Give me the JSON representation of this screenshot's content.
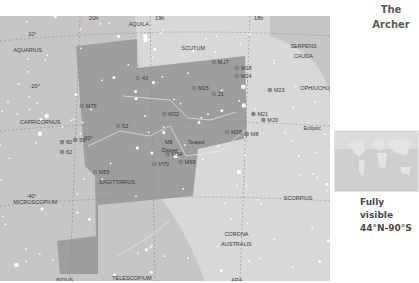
{
  "title": {
    "line1": "The",
    "line2": "Archer"
  },
  "visibility": {
    "line1": "Fully visible",
    "line2": "44°N-90°S"
  },
  "colors": {
    "background": "#c6c6c6",
    "sagittarius_area": "#9e9e9e",
    "milky_way": "#d8d8d8",
    "grid_line": "#8c8c8c",
    "constellation_line": "#e8e8e8",
    "star": "#ffffff"
  },
  "chart_data": {
    "type": "map",
    "ra_labels": [
      {
        "text": "20h",
        "x": 0.27,
        "y": 0.02
      },
      {
        "text": "19h",
        "x": 0.47,
        "y": 0.02
      },
      {
        "text": "18h",
        "x": 0.77,
        "y": 0.02
      }
    ],
    "dec_labels": [
      {
        "text": "-10°",
        "x": 0.08,
        "y": 0.1
      },
      {
        "text": "-20°",
        "x": 0.09,
        "y": 0.36
      },
      {
        "text": "-30°",
        "x": 0.25,
        "y": 0.62
      },
      {
        "text": "-40°",
        "x": 0.08,
        "y": 0.91
      }
    ],
    "constellations": [
      {
        "name": "AQUARIUS",
        "x": 0.04,
        "y": 0.18
      },
      {
        "name": "AQUILA",
        "x": 0.39,
        "y": 0.05
      },
      {
        "name": "SCUTUM",
        "x": 0.55,
        "y": 0.17
      },
      {
        "name": "SERPENS",
        "x": 0.88,
        "y": 0.16
      },
      {
        "name": "CAUDA",
        "x": 0.89,
        "y": 0.21
      },
      {
        "name": "OPHIUCHUS",
        "x": 0.91,
        "y": 0.37
      },
      {
        "name": "CAPRICORNUS",
        "x": 0.06,
        "y": 0.54
      },
      {
        "name": "SAGITTARIUS",
        "x": 0.3,
        "y": 0.84
      },
      {
        "name": "SCORPIUS",
        "x": 0.86,
        "y": 0.92
      },
      {
        "name": "MICROSCOPIUM",
        "x": 0.04,
        "y": 0.94
      },
      {
        "name": "CORONA",
        "x": 0.68,
        "y": 1.1
      },
      {
        "name": "AUSTRALIS",
        "x": 0.67,
        "y": 1.15
      },
      {
        "name": "INDUS",
        "x": 0.17,
        "y": 1.33
      },
      {
        "name": "TELESCOPIUM",
        "x": 0.34,
        "y": 1.32
      },
      {
        "name": "ARA",
        "x": 0.7,
        "y": 1.33
      }
    ],
    "deep_sky_objects": [
      {
        "name": "M17",
        "x": 0.66,
        "y": 0.24
      },
      {
        "name": "M18",
        "x": 0.73,
        "y": 0.27
      },
      {
        "name": "M24",
        "x": 0.73,
        "y": 0.31
      },
      {
        "name": "M25",
        "x": 0.6,
        "y": 0.37
      },
      {
        "name": "21",
        "x": 0.66,
        "y": 0.4
      },
      {
        "name": "M23",
        "x": 0.83,
        "y": 0.38
      },
      {
        "name": "M21",
        "x": 0.78,
        "y": 0.5
      },
      {
        "name": "M20",
        "x": 0.81,
        "y": 0.53
      },
      {
        "name": "M28",
        "x": 0.7,
        "y": 0.59
      },
      {
        "name": "M8",
        "x": 0.76,
        "y": 0.6
      },
      {
        "name": "M22",
        "x": 0.51,
        "y": 0.5
      },
      {
        "name": "M75",
        "x": 0.26,
        "y": 0.46
      },
      {
        "name": "M55",
        "x": 0.3,
        "y": 0.79
      },
      {
        "name": "M54",
        "x": 0.52,
        "y": 0.7
      },
      {
        "name": "M70",
        "x": 0.48,
        "y": 0.75
      },
      {
        "name": "M69",
        "x": 0.56,
        "y": 0.74
      },
      {
        "name": "43",
        "x": 0.43,
        "y": 0.32
      },
      {
        "name": "52",
        "x": 0.37,
        "y": 0.56
      },
      {
        "name": "59",
        "x": 0.24,
        "y": 0.63
      },
      {
        "name": "60",
        "x": 0.2,
        "y": 0.64
      },
      {
        "name": "62",
        "x": 0.2,
        "y": 0.69
      }
    ],
    "asterisms": [
      {
        "name": "M8",
        "x": 0.5,
        "y": 0.64
      },
      {
        "name": "Dipper",
        "x": 0.49,
        "y": 0.68
      },
      {
        "name": "Teapot",
        "x": 0.57,
        "y": 0.64
      }
    ],
    "other_labels": [
      {
        "name": "Ecliptic",
        "x": 0.92,
        "y": 0.57
      }
    ]
  }
}
